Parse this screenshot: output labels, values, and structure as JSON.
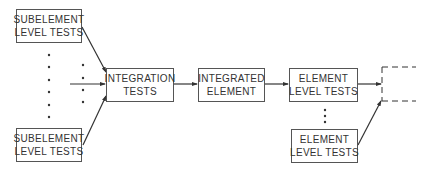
{
  "diagram": {
    "nodes": {
      "sub_top": {
        "line1": "SUBELEMENT",
        "line2": "LEVEL TESTS"
      },
      "sub_bottom": {
        "line1": "SUBELEMENT",
        "line2": "LEVEL TESTS"
      },
      "integration": {
        "line1": "INTEGRATION",
        "line2": "TESTS"
      },
      "integrated": {
        "line1": "INTEGRATED",
        "line2": "ELEMENT"
      },
      "elem_top": {
        "line1": "ELEMENT",
        "line2": "LEVEL TESTS"
      },
      "elem_bottom": {
        "line1": "ELEMENT",
        "line2": "LEVEL TESTS"
      }
    },
    "edges": [
      {
        "from": "sub_top",
        "to": "integration"
      },
      {
        "from": "ellipsis_inputs",
        "to": "integration"
      },
      {
        "from": "sub_bottom",
        "to": "integration"
      },
      {
        "from": "integration",
        "to": "integrated"
      },
      {
        "from": "integrated",
        "to": "elem_top"
      },
      {
        "from": "elem_top",
        "to": "next_stage"
      },
      {
        "from": "elem_bottom",
        "to": "next_stage"
      }
    ],
    "next_stage": {
      "style": "dashed",
      "label": ""
    },
    "line_color": "#333333"
  }
}
